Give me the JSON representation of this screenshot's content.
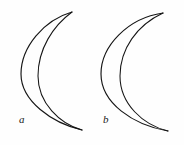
{
  "figure": {
    "background_color": "#fefefe",
    "stroke_color": "#151515",
    "width": 184,
    "height": 145,
    "shapes": [
      {
        "id": "crescent-a",
        "label": "a",
        "label_position": {
          "x": 23,
          "y": 120
        },
        "top_tip": {
          "x": 72,
          "y": 12
        },
        "bottom_tip": {
          "x": 82,
          "y": 130
        },
        "outer_arc_extreme_x": 21,
        "inner_arc_extreme_x": 38,
        "outer_arc_path": "M 72 12 C 44 20, 21 47, 21 74 C 21 101, 52 123, 82 130",
        "inner_arc_path": "M 72 12 C 53 26, 38 49, 38 76 C 38 103, 60 124, 82 130"
      },
      {
        "id": "crescent-b",
        "label": "b",
        "label_position": {
          "x": 107,
          "y": 120
        },
        "top_tip": {
          "x": 163,
          "y": 13
        },
        "bottom_tip": {
          "x": 168,
          "y": 131
        },
        "outer_arc_extreme_x": 101,
        "inner_arc_extreme_x": 120,
        "outer_arc_path": "M 163 13 C 128 18, 101 46, 101 74 C 101 103, 133 125, 168 131",
        "inner_arc_path": "M 163 13 C 137 25, 120 49, 120 76 C 120 104, 143 125, 168 131"
      }
    ]
  },
  "labels": {
    "a": "a",
    "b": "b"
  }
}
